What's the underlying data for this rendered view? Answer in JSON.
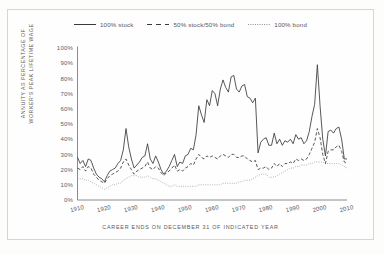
{
  "figure": {
    "frame_color": "#d8d6d2",
    "background": "#fefefe"
  },
  "legend": {
    "position": "top-center",
    "items": [
      {
        "label": "100% stock",
        "style": "solid",
        "icon": "solid-line-icon"
      },
      {
        "label": "50% stock/50% bond",
        "style": "dashed",
        "icon": "dashed-line-icon"
      },
      {
        "label": "100% bond",
        "style": "dotted",
        "icon": "dotted-line-icon"
      }
    ]
  },
  "axes": {
    "ylabel_line1": "ANNUITY AS PERCENTAGE OF",
    "ylabel_line2": "WORKER'S PEAK LIFETIME WAGE",
    "xlabel": "CAREER ENDS ON DECEMBER 31 OF INDICATED YEAR",
    "yticks": [
      "0%",
      "10%",
      "20%",
      "30%",
      "40%",
      "50%",
      "60%",
      "70%",
      "80%",
      "90%",
      "100%"
    ],
    "xticks": [
      "1910",
      "1920",
      "1930",
      "1940",
      "1950",
      "1960",
      "1970",
      "1980",
      "1990",
      "2000",
      "2010"
    ]
  },
  "chart_data": {
    "type": "line",
    "title": "",
    "subtitle": "",
    "xlabel": "CAREER ENDS ON DECEMBER 31 OF INDICATED YEAR",
    "ylabel": "ANNUITY AS PERCENTAGE OF WORKER'S PEAK LIFETIME WAGE",
    "xlim": [
      1910,
      2010
    ],
    "ylim": [
      0,
      100
    ],
    "yticks": [
      0,
      10,
      20,
      30,
      40,
      50,
      60,
      70,
      80,
      90,
      100
    ],
    "xticks": [
      1910,
      1920,
      1930,
      1940,
      1950,
      1960,
      1970,
      1980,
      1990,
      2000,
      2010
    ],
    "grid": false,
    "legend_position": "top-center",
    "y_unit": "percent",
    "x": [
      1910,
      1911,
      1912,
      1913,
      1914,
      1915,
      1916,
      1917,
      1918,
      1919,
      1920,
      1921,
      1922,
      1923,
      1924,
      1925,
      1926,
      1927,
      1928,
      1929,
      1930,
      1931,
      1932,
      1933,
      1934,
      1935,
      1936,
      1937,
      1938,
      1939,
      1940,
      1941,
      1942,
      1943,
      1944,
      1945,
      1946,
      1947,
      1948,
      1949,
      1950,
      1951,
      1952,
      1953,
      1954,
      1955,
      1956,
      1957,
      1958,
      1959,
      1960,
      1961,
      1962,
      1963,
      1964,
      1965,
      1966,
      1967,
      1968,
      1969,
      1970,
      1971,
      1972,
      1973,
      1974,
      1975,
      1976,
      1977,
      1978,
      1979,
      1980,
      1981,
      1982,
      1983,
      1984,
      1985,
      1986,
      1987,
      1988,
      1989,
      1990,
      1991,
      1992,
      1993,
      1994,
      1995,
      1996,
      1997,
      1998,
      1999,
      2000,
      2001,
      2002,
      2003,
      2004,
      2005,
      2006,
      2007,
      2008,
      2009,
      2010
    ],
    "series": [
      {
        "name": "100% stock",
        "style": "solid",
        "color": "#3a3a3c",
        "values": [
          28,
          24,
          26,
          22,
          27,
          26,
          21,
          17,
          15,
          14,
          12,
          16,
          19,
          20,
          21,
          24,
          26,
          33,
          47,
          35,
          27,
          21,
          23,
          25,
          28,
          29,
          37,
          27,
          24,
          29,
          25,
          20,
          17,
          19,
          22,
          26,
          30,
          22,
          25,
          24,
          29,
          30,
          34,
          33,
          43,
          62,
          56,
          51,
          66,
          62,
          72,
          70,
          62,
          73,
          79,
          74,
          71,
          81,
          82,
          73,
          71,
          75,
          76,
          68,
          67,
          64,
          67,
          31,
          38,
          40,
          41,
          36,
          36,
          44,
          37,
          40,
          36,
          39,
          38,
          40,
          37,
          43,
          40,
          41,
          37,
          39,
          45,
          55,
          63,
          89,
          62,
          40,
          29,
          45,
          46,
          44,
          47,
          48,
          40,
          27,
          27
        ]
      },
      {
        "name": "50% stock/50% bond",
        "style": "dashed",
        "color": "#3a3a3c",
        "values": [
          21,
          20,
          22,
          19,
          22,
          21,
          17,
          15,
          13,
          12,
          11,
          14,
          16,
          17,
          18,
          19,
          21,
          25,
          27,
          23,
          20,
          17,
          19,
          20,
          21,
          22,
          25,
          21,
          20,
          22,
          21,
          18,
          16,
          18,
          19,
          21,
          23,
          19,
          20,
          19,
          21,
          22,
          24,
          23,
          27,
          30,
          28,
          27,
          29,
          28,
          29,
          28,
          27,
          29,
          30,
          29,
          28,
          30,
          30,
          28,
          28,
          29,
          29,
          27,
          26,
          25,
          26,
          20,
          21,
          21,
          22,
          20,
          21,
          24,
          22,
          24,
          22,
          24,
          24,
          25,
          24,
          27,
          26,
          27,
          26,
          27,
          30,
          34,
          38,
          47,
          41,
          30,
          24,
          32,
          33,
          33,
          35,
          36,
          32,
          25,
          24
        ]
      },
      {
        "name": "100% bond",
        "style": "dotted",
        "color": "#8d8c8e",
        "values": [
          14,
          14,
          14,
          13,
          13,
          12,
          11,
          10,
          9,
          8,
          7,
          8,
          9,
          10,
          10,
          11,
          11,
          13,
          14,
          15,
          16,
          16,
          16,
          15,
          15,
          15,
          16,
          15,
          14,
          14,
          13,
          12,
          11,
          10,
          9,
          9,
          10,
          9,
          9,
          9,
          9,
          9,
          9,
          9,
          9,
          10,
          10,
          10,
          10,
          10,
          10,
          10,
          10,
          10,
          11,
          11,
          11,
          11,
          11,
          11,
          12,
          12,
          13,
          13,
          13,
          14,
          15,
          16,
          17,
          17,
          17,
          15,
          15,
          15,
          16,
          17,
          18,
          19,
          20,
          21,
          21,
          22,
          22,
          23,
          23,
          23,
          24,
          24,
          25,
          25,
          25,
          25,
          24,
          24,
          24,
          24,
          24,
          24,
          23,
          22,
          21
        ]
      }
    ]
  }
}
